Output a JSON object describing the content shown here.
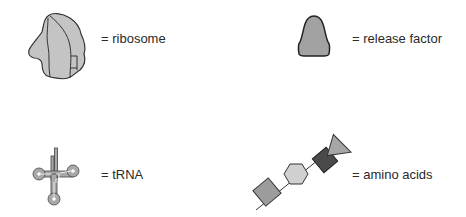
{
  "legend": {
    "items": [
      {
        "id": "ribosome",
        "label": "= ribosome",
        "icon": "ribosome-icon"
      },
      {
        "id": "release-factor",
        "label": "= release factor",
        "icon": "release-factor-icon"
      },
      {
        "id": "trna",
        "label": "= tRNA",
        "icon": "trna-icon"
      },
      {
        "id": "amino-acids",
        "label": "= amino acids",
        "icon": "amino-acid-chain-icon"
      }
    ]
  },
  "colors": {
    "ribosome_fill": "#c4c4c4",
    "release_factor_fill": "#a2a2a2",
    "trna_fill": "#a8a8a8",
    "amino_square_bottom": "#9c9c9c",
    "amino_hexagon": "#d0d0d0",
    "amino_square_dark": "#4a4a4a",
    "amino_triangle": "#a6a6a6",
    "outline": "#333333",
    "text": "#2a2a2a"
  }
}
